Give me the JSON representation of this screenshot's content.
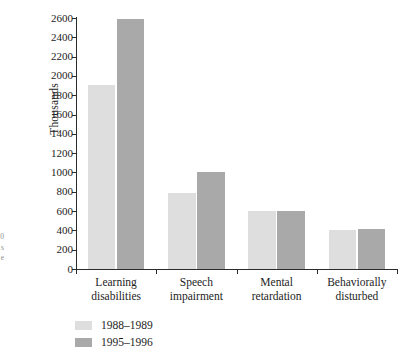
{
  "figure": {
    "y_axis_title": "Thousands",
    "margin_fragments": [
      "0",
      "s",
      "e"
    ]
  },
  "legend": {
    "position": "bottom-left",
    "entries": [
      {
        "label": "1988–1989",
        "color": "#dedede"
      },
      {
        "label": "1995–1996",
        "color": "#a9a9a9"
      }
    ]
  },
  "chart_data": {
    "type": "bar",
    "title": "",
    "subtitle": "",
    "xlabel": "",
    "ylabel": "Thousands",
    "ylim": [
      0,
      2600
    ],
    "ytick_step": 200,
    "yticks": [
      0,
      200,
      400,
      600,
      800,
      1000,
      1200,
      1400,
      1600,
      1800,
      2000,
      2200,
      2400,
      2600
    ],
    "ytick_labels": [
      "0",
      "200",
      "400",
      "600",
      "800",
      "1000",
      "1200",
      "1400",
      "1600",
      "1800",
      "2000",
      "2200",
      "2400",
      "2600"
    ],
    "grid": false,
    "categories": [
      "Learning disabilities",
      "Speech impairment",
      "Mental retardation",
      "Behaviorally disturbed"
    ],
    "category_lines": [
      [
        "Learning",
        "disabilities"
      ],
      [
        "Speech",
        "impairment"
      ],
      [
        "Mental",
        "retardation"
      ],
      [
        "Behaviorally",
        "disturbed"
      ]
    ],
    "series": [
      {
        "name": "1988–1989",
        "color": "#dedede",
        "values": [
          1910,
          790,
          600,
          405
        ]
      },
      {
        "name": "1995–1996",
        "color": "#a9a9a9",
        "values": [
          2590,
          1010,
          600,
          415
        ]
      }
    ]
  }
}
